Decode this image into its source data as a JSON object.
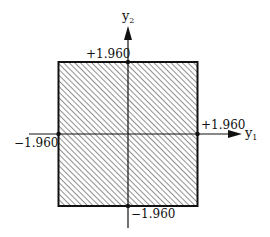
{
  "diagram": {
    "type": "rectangular acceptance region",
    "axes": {
      "x": {
        "label": "y",
        "subscript": "1"
      },
      "y": {
        "label": "y",
        "subscript": "2"
      }
    },
    "region": {
      "shape": "square",
      "fill": "diagonal hatching",
      "bounds": {
        "x_min": -1.96,
        "x_max": 1.96,
        "y_min": -1.96,
        "y_max": 1.96
      }
    },
    "labels": {
      "top": "+1.960",
      "right": "+1.960",
      "left": "−1.960",
      "bottom": "−1.960"
    }
  },
  "colors": {
    "stroke": "#111111",
    "hatch": "#555555",
    "background": "#ffffff"
  }
}
